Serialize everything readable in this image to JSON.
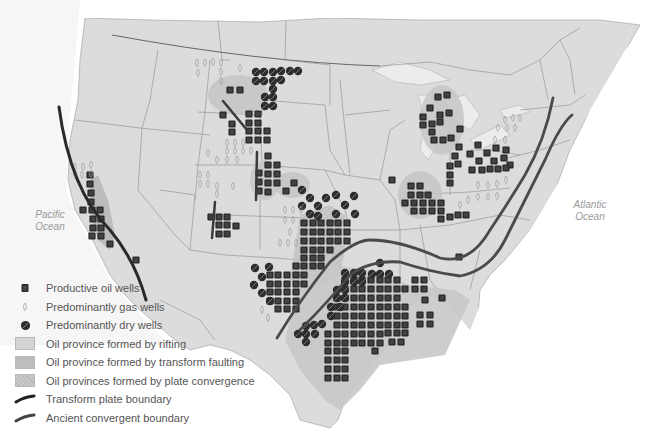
{
  "map": {
    "ocean_labels": {
      "pacific": {
        "line1": "Pacific",
        "line2": "Ocean"
      },
      "atlantic": {
        "line1": "Atlantic",
        "line2": "Ocean"
      }
    },
    "colors": {
      "land": "#dcdcdc",
      "border": "#8c8c8c",
      "rifting": "#d2d2d2",
      "transform": "#bcbcbc",
      "convergence": "#c4c4c4",
      "wells": "#2d2d2d",
      "boundary": "#353535"
    }
  },
  "legend": {
    "items": [
      {
        "symbol": "oil-well-icon",
        "label": "Productive oil wells"
      },
      {
        "symbol": "gas-well-icon",
        "label": "Predominantly gas wells"
      },
      {
        "symbol": "dry-well-icon",
        "label": "Predominantly dry wells"
      },
      {
        "symbol": "rifting-swatch",
        "label": "Oil province formed by rifting"
      },
      {
        "symbol": "transform-swatch",
        "label": "Oil province formed by transform faulting"
      },
      {
        "symbol": "convergence-swatch",
        "label": "Oil provinces formed by plate convergence"
      },
      {
        "symbol": "transform-boundary-line",
        "label": "Transform plate boundary"
      },
      {
        "symbol": "convergent-boundary-line",
        "label": "Ancient convergent boundary"
      }
    ]
  }
}
